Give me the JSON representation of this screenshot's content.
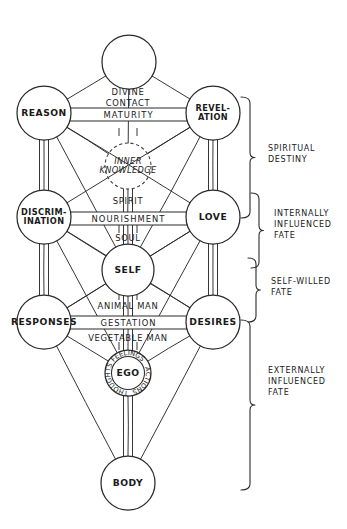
{
  "diagram": {
    "type": "kabbalistic-tree-of-life",
    "style": "hand-drawn ink sketch, black on white",
    "nodes": [
      {
        "id": "crown",
        "label": "",
        "cx": 129,
        "cy": 62,
        "r": 27,
        "label_lines": []
      },
      {
        "id": "reason",
        "label": "REASON",
        "cx": 44,
        "cy": 113,
        "r": 27,
        "label_lines": [
          "REASON"
        ]
      },
      {
        "id": "revelation",
        "label": "REVEL-ATION",
        "cx": 213,
        "cy": 113,
        "r": 27,
        "label_lines": [
          "REVEL-",
          "ATION"
        ]
      },
      {
        "id": "inner-knowledge",
        "label": "INNER KNOWLEDGE",
        "cx": 128,
        "cy": 166,
        "r": 23,
        "label_lines": [
          "INNER",
          "KNOWLEDGE"
        ],
        "dashed": true
      },
      {
        "id": "discrimination",
        "label": "DISCRIM-INATION",
        "cx": 44,
        "cy": 217,
        "r": 27,
        "label_lines": [
          "DISCRIM-",
          "INATION"
        ]
      },
      {
        "id": "love",
        "label": "LOVE",
        "cx": 213,
        "cy": 217,
        "r": 27,
        "label_lines": [
          "LOVE"
        ]
      },
      {
        "id": "self",
        "label": "SELF",
        "cx": 128,
        "cy": 270,
        "r": 26,
        "label_lines": [
          "SELF"
        ]
      },
      {
        "id": "responses",
        "label": "RESPONSES",
        "cx": 44,
        "cy": 322,
        "r": 27,
        "label_lines": [
          "RESPONSES"
        ]
      },
      {
        "id": "desires",
        "label": "DESIRES",
        "cx": 213,
        "cy": 322,
        "r": 27,
        "label_lines": [
          "DESIRES"
        ]
      },
      {
        "id": "ego",
        "label": "EGO",
        "cx": 128,
        "cy": 373,
        "r": 23,
        "label_lines": [
          "EGO"
        ],
        "ring": true
      },
      {
        "id": "body",
        "label": "BODY",
        "cx": 128,
        "cy": 483,
        "r": 27,
        "label_lines": [
          "BODY"
        ]
      }
    ],
    "ego_ring_labels": [
      "FEELINGS",
      "ACTIONS",
      "THOUGHTS"
    ],
    "path_labels": [
      {
        "id": "divine-contact-1",
        "text": "DIVINE",
        "x": 128,
        "y": 92
      },
      {
        "id": "divine-contact-2",
        "text": "CONTACT",
        "x": 128,
        "y": 103
      },
      {
        "id": "spirit",
        "text": "SPIRIT",
        "x": 128,
        "y": 201
      },
      {
        "id": "soul",
        "text": "SOUL",
        "x": 128,
        "y": 238
      },
      {
        "id": "animal-man",
        "text": "ANIMAL MAN",
        "x": 128,
        "y": 306
      },
      {
        "id": "vegetable-man",
        "text": "VEGETABLE MAN",
        "x": 128,
        "y": 338
      }
    ],
    "bands": [
      {
        "id": "maturity",
        "text": "MATURITY",
        "x": 54,
        "y": 108,
        "w": 149,
        "h": 13
      },
      {
        "id": "nourishment",
        "text": "NOURISHMENT",
        "x": 54,
        "y": 212,
        "w": 149,
        "h": 13
      },
      {
        "id": "gestation",
        "text": "GESTATION",
        "x": 54,
        "y": 316,
        "w": 149,
        "h": 13
      }
    ],
    "edges": [
      [
        "crown",
        "reason"
      ],
      [
        "crown",
        "revelation"
      ],
      [
        "crown",
        "inner-knowledge"
      ],
      [
        "reason",
        "revelation"
      ],
      [
        "reason",
        "discrimination"
      ],
      [
        "revelation",
        "love"
      ],
      [
        "reason",
        "inner-knowledge"
      ],
      [
        "revelation",
        "inner-knowledge"
      ],
      [
        "reason",
        "love"
      ],
      [
        "revelation",
        "discrimination"
      ],
      [
        "reason",
        "self"
      ],
      [
        "revelation",
        "self"
      ],
      [
        "inner-knowledge",
        "self"
      ],
      [
        "discrimination",
        "love"
      ],
      [
        "discrimination",
        "self"
      ],
      [
        "love",
        "self"
      ],
      [
        "discrimination",
        "responses"
      ],
      [
        "love",
        "desires"
      ],
      [
        "discrimination",
        "desires"
      ],
      [
        "love",
        "responses"
      ],
      [
        "discrimination",
        "ego"
      ],
      [
        "love",
        "ego"
      ],
      [
        "self",
        "responses"
      ],
      [
        "self",
        "desires"
      ],
      [
        "self",
        "ego"
      ],
      [
        "responses",
        "desires"
      ],
      [
        "responses",
        "ego"
      ],
      [
        "desires",
        "ego"
      ],
      [
        "responses",
        "body"
      ],
      [
        "desires",
        "body"
      ],
      [
        "ego",
        "body"
      ]
    ],
    "brackets": [
      {
        "id": "spiritual-destiny",
        "lines": [
          "SPIRITUAL",
          "DESTINY"
        ],
        "x": 250,
        "y0": 97,
        "y1": 218,
        "depth": 9,
        "text_x": 268,
        "text_y": 148
      },
      {
        "id": "internally-influenced",
        "lines": [
          "INTERNALLY",
          "INFLUENCED",
          "FATE"
        ],
        "x": 259,
        "y0": 193,
        "y1": 268,
        "depth": 8,
        "text_x": 274,
        "text_y": 213
      },
      {
        "id": "self-willed",
        "lines": [
          "SELF-WILLED",
          "FATE"
        ],
        "x": 256,
        "y0": 258,
        "y1": 322,
        "depth": 8,
        "text_x": 271,
        "text_y": 281
      },
      {
        "id": "externally-influenced",
        "lines": [
          "EXTERNALLY",
          "INFLUENCED",
          "FATE"
        ],
        "x": 250,
        "y0": 320,
        "y1": 490,
        "depth": 9,
        "text_x": 268,
        "text_y": 370
      }
    ],
    "colors": {
      "ink": "#2b2b2b",
      "text": "#1a1a1a",
      "paper": "#ffffff"
    }
  }
}
